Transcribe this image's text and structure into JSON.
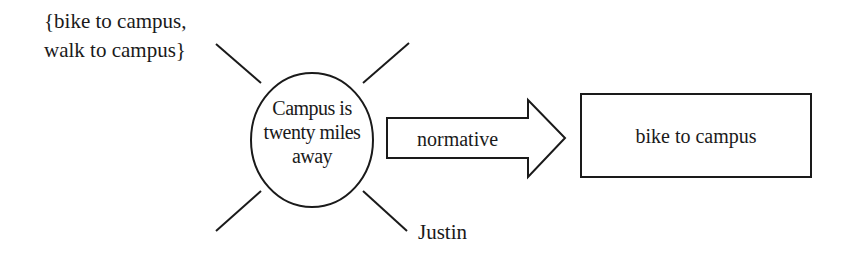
{
  "diagram": {
    "options_label": {
      "line1": "{bike to campus,",
      "line2": "walk to campus}"
    },
    "center_node": {
      "line1": "Campus is",
      "line2": "twenty miles",
      "line3": "away"
    },
    "agent_label": "Justin",
    "arrow_label": "normative",
    "result_box": "bike to campus",
    "colors": {
      "stroke": "#1a1a1a",
      "background": "#ffffff"
    }
  }
}
